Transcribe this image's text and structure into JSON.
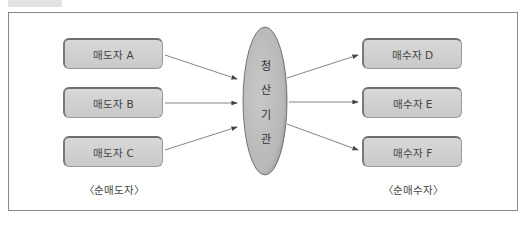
{
  "diagram": {
    "sellers": [
      {
        "label": "매도자 A"
      },
      {
        "label": "매도자 B"
      },
      {
        "label": "매도자 C"
      }
    ],
    "buyers": [
      {
        "label": "매수자 D"
      },
      {
        "label": "매수자 E"
      },
      {
        "label": "매수자 F"
      }
    ],
    "center": {
      "chars": [
        "청",
        "산",
        "기",
        "관"
      ],
      "label": "청산기관"
    },
    "captions": {
      "left": "〈순매도자〉",
      "right": "〈순매수자〉"
    },
    "colors": {
      "box_fill": "#d0d0d0",
      "ellipse_fill": "#bdbdbd",
      "frame": "#8a8a8a",
      "arrow": "#555555"
    }
  }
}
